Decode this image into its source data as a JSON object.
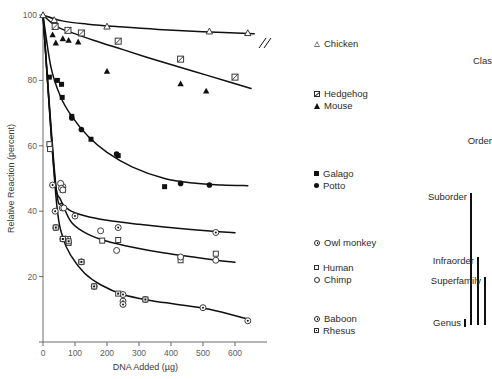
{
  "chart_data": {
    "type": "scatter",
    "title": "",
    "xlabel": "DNA Added (µg)",
    "ylabel": "Relative Reaction (percent)",
    "xlim": [
      0,
      700
    ],
    "ylim": [
      0,
      100
    ],
    "xticks": [
      0,
      100,
      200,
      300,
      400,
      500,
      600
    ],
    "yticks": [
      0,
      20,
      40,
      60,
      80,
      100
    ],
    "grid": false,
    "legend_position": "right",
    "axis_break_on_chicken_line": true,
    "series": [
      {
        "name": "Chicken",
        "marker": "open-triangle",
        "points": [
          [
            0,
            100
          ],
          [
            35,
            98.5
          ],
          [
            200,
            96.5
          ],
          [
            520,
            95.0
          ],
          [
            640,
            94.5
          ]
        ],
        "curve": [
          [
            0,
            100
          ],
          [
            60,
            98.2
          ],
          [
            140,
            97.2
          ],
          [
            240,
            96.4
          ],
          [
            360,
            95.6
          ],
          [
            500,
            94.9
          ],
          [
            660,
            94.3
          ]
        ]
      },
      {
        "name": "Hedgehog",
        "marker": "crossed-square",
        "points": [
          [
            38,
            96.5
          ],
          [
            78,
            95.3
          ],
          [
            120,
            94.5
          ],
          [
            235,
            92.0
          ],
          [
            430,
            86.5
          ],
          [
            600,
            81.0
          ]
        ],
        "curve": [
          [
            0,
            100
          ],
          [
            40,
            96.6
          ],
          [
            90,
            94.6
          ],
          [
            160,
            92.2
          ],
          [
            250,
            89.4
          ],
          [
            360,
            86.0
          ],
          [
            470,
            82.8
          ],
          [
            580,
            79.6
          ],
          [
            650,
            77.5
          ]
        ]
      },
      {
        "name": "Mouse",
        "marker": "filled-triangle",
        "points": [
          [
            30,
            94.0
          ],
          [
            40,
            91.5
          ],
          [
            62,
            92.8
          ],
          [
            80,
            92.3
          ],
          [
            110,
            91.8
          ],
          [
            200,
            82.8
          ],
          [
            430,
            79.0
          ],
          [
            510,
            76.8
          ]
        ],
        "curve": [
          [
            0,
            100
          ],
          [
            40,
            96.6
          ],
          [
            90,
            94.6
          ],
          [
            160,
            92.2
          ],
          [
            250,
            89.4
          ],
          [
            360,
            86.0
          ],
          [
            470,
            82.8
          ],
          [
            580,
            79.6
          ],
          [
            650,
            77.5
          ]
        ]
      },
      {
        "name": "Galago",
        "marker": "filled-square",
        "points": [
          [
            20,
            81.0
          ],
          [
            45,
            80.0
          ],
          [
            58,
            78.8
          ],
          [
            60,
            74.8
          ],
          [
            90,
            69.0
          ],
          [
            150,
            62.0
          ],
          [
            235,
            57.0
          ],
          [
            380,
            47.5
          ]
        ],
        "curve": [
          [
            0,
            100
          ],
          [
            25,
            84.0
          ],
          [
            55,
            75.0
          ],
          [
            90,
            69.0
          ],
          [
            140,
            63.0
          ],
          [
            200,
            58.0
          ],
          [
            280,
            53.5
          ],
          [
            380,
            50.0
          ],
          [
            470,
            48.6
          ],
          [
            560,
            48.0
          ],
          [
            640,
            47.8
          ]
        ]
      },
      {
        "name": "Potto",
        "marker": "filled-circle",
        "points": [
          [
            90,
            68.5
          ],
          [
            120,
            65.0
          ],
          [
            230,
            57.5
          ],
          [
            430,
            48.5
          ],
          [
            520,
            48.0
          ]
        ],
        "curve": [
          [
            0,
            100
          ],
          [
            25,
            84.0
          ],
          [
            55,
            75.0
          ],
          [
            90,
            69.0
          ],
          [
            140,
            63.0
          ],
          [
            200,
            58.0
          ],
          [
            280,
            53.5
          ],
          [
            380,
            50.0
          ],
          [
            470,
            48.6
          ],
          [
            560,
            48.0
          ],
          [
            640,
            47.8
          ]
        ]
      },
      {
        "name": "Owl monkey",
        "marker": "dot-circle",
        "points": [
          [
            30,
            48.0
          ],
          [
            38,
            40.0
          ],
          [
            40,
            35.0
          ],
          [
            60,
            41.0
          ],
          [
            62,
            47.5
          ],
          [
            100,
            38.5
          ],
          [
            235,
            35.0
          ],
          [
            540,
            33.5
          ]
        ],
        "curve": [
          [
            0,
            100
          ],
          [
            35,
            52.0
          ],
          [
            55,
            43.5
          ],
          [
            80,
            40.5
          ],
          [
            130,
            38.6
          ],
          [
            200,
            37.2
          ],
          [
            300,
            36.0
          ],
          [
            420,
            34.8
          ],
          [
            540,
            33.8
          ],
          [
            600,
            33.4
          ]
        ]
      },
      {
        "name": "Human",
        "marker": "open-square",
        "points": [
          [
            20,
            60.5
          ],
          [
            22,
            59.0
          ],
          [
            62,
            46.5
          ],
          [
            78,
            31.5
          ],
          [
            80,
            30.3
          ],
          [
            185,
            31.0
          ],
          [
            235,
            31.2
          ],
          [
            430,
            25.0
          ],
          [
            540,
            27.0
          ]
        ],
        "curve": [
          [
            0,
            100
          ],
          [
            40,
            48.0
          ],
          [
            62,
            42.0
          ],
          [
            90,
            36.5
          ],
          [
            140,
            33.0
          ],
          [
            200,
            30.8
          ],
          [
            280,
            29.0
          ],
          [
            380,
            27.2
          ],
          [
            470,
            26.0
          ],
          [
            560,
            24.8
          ],
          [
            600,
            24.4
          ]
        ]
      },
      {
        "name": "Chimp",
        "marker": "open-circle",
        "points": [
          [
            55,
            48.5
          ],
          [
            58,
            47.0
          ],
          [
            62,
            46.5
          ],
          [
            65,
            41.0
          ],
          [
            70,
            31.5
          ],
          [
            180,
            34.0
          ],
          [
            230,
            28.0
          ],
          [
            430,
            26.0
          ],
          [
            540,
            25.0
          ]
        ],
        "curve": [
          [
            0,
            100
          ],
          [
            40,
            48.0
          ],
          [
            62,
            42.0
          ],
          [
            90,
            36.5
          ],
          [
            140,
            33.0
          ],
          [
            200,
            30.8
          ],
          [
            280,
            29.0
          ],
          [
            380,
            27.2
          ],
          [
            470,
            26.0
          ],
          [
            560,
            24.8
          ],
          [
            600,
            24.4
          ]
        ]
      },
      {
        "name": "Baboon",
        "marker": "dot-circle",
        "points": [
          [
            62,
            31.5
          ],
          [
            120,
            24.5
          ],
          [
            160,
            17.0
          ],
          [
            250,
            14.5
          ],
          [
            250,
            12.5
          ],
          [
            250,
            11.5
          ],
          [
            320,
            13.0
          ],
          [
            500,
            10.5
          ],
          [
            640,
            6.5
          ]
        ],
        "curve": [
          [
            0,
            100
          ],
          [
            40,
            45.0
          ],
          [
            62,
            32.0
          ],
          [
            90,
            26.0
          ],
          [
            130,
            21.0
          ],
          [
            180,
            17.5
          ],
          [
            250,
            14.5
          ],
          [
            330,
            12.8
          ],
          [
            420,
            11.5
          ],
          [
            520,
            10.0
          ],
          [
            640,
            7.0
          ]
        ]
      },
      {
        "name": "Rhesus",
        "marker": "dot-square",
        "points": [
          [
            40,
            35.0
          ],
          [
            62,
            31.5
          ],
          [
            80,
            30.8
          ],
          [
            120,
            24.5
          ],
          [
            160,
            17.0
          ],
          [
            235,
            14.8
          ],
          [
            320,
            13.0
          ]
        ],
        "curve": [
          [
            0,
            100
          ],
          [
            40,
            45.0
          ],
          [
            62,
            32.0
          ],
          [
            90,
            26.0
          ],
          [
            130,
            21.0
          ],
          [
            180,
            17.5
          ],
          [
            250,
            14.5
          ],
          [
            330,
            12.8
          ],
          [
            420,
            11.5
          ],
          [
            520,
            10.0
          ],
          [
            640,
            7.0
          ]
        ]
      }
    ]
  },
  "legend": {
    "groups": [
      {
        "items": [
          {
            "label": "Chicken",
            "marker": "open-triangle"
          }
        ]
      },
      {
        "items": [
          {
            "label": "Hedgehog",
            "marker": "crossed-square"
          },
          {
            "label": "Mouse",
            "marker": "filled-triangle"
          }
        ]
      },
      {
        "items": [
          {
            "label": "Galago",
            "marker": "filled-square"
          },
          {
            "label": "Potto",
            "marker": "filled-circle"
          }
        ]
      },
      {
        "items": [
          {
            "label": "Owl monkey",
            "marker": "dot-circle"
          }
        ]
      },
      {
        "items": [
          {
            "label": "Human",
            "marker": "open-square"
          },
          {
            "label": "Chimp",
            "marker": "open-circle"
          }
        ]
      },
      {
        "items": [
          {
            "label": "Baboon",
            "marker": "dot-circle"
          },
          {
            "label": "Rhesus",
            "marker": "dot-square"
          }
        ]
      }
    ]
  },
  "taxonomy": {
    "items": [
      {
        "label": "Clas",
        "truncated": true
      },
      {
        "label": "Order"
      },
      {
        "label": "Suborder"
      },
      {
        "label": "Infraorder"
      },
      {
        "label": "Superfamily"
      },
      {
        "label": "Genus"
      }
    ]
  }
}
